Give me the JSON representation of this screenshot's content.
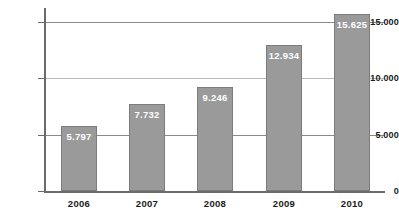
{
  "chart_data": {
    "type": "bar",
    "title": "",
    "subtitle": "",
    "xlabel": "",
    "ylabel": "",
    "categories": [
      "2006",
      "2007",
      "2008",
      "2009",
      "2010"
    ],
    "values": [
      5797,
      7732,
      9246,
      12934,
      15625
    ],
    "value_labels": [
      "5.797",
      "7.732",
      "9.246",
      "12.934",
      "15.625"
    ],
    "ylim": [
      0,
      16200
    ],
    "yticks": [
      0,
      5000,
      10000,
      15000
    ],
    "ytick_labels": [
      "0",
      "5.000",
      "10.000",
      "15.000"
    ],
    "grid": "horizontal",
    "legend": "none",
    "series": [
      {
        "name": "",
        "values": [
          5797,
          7732,
          9246,
          12934,
          15625
        ]
      }
    ],
    "colors": {
      "bar_fill": "#9a9a9a",
      "bar_border": "#7c7c7c",
      "value_label": "#ffffff",
      "axis": "#6b6b6b",
      "gridline": "#8a8a8a",
      "tick_label": "#1a1a1a",
      "background": "#ffffff"
    }
  }
}
